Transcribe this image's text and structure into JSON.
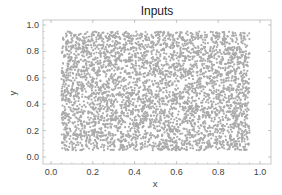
{
  "chart_data": {
    "type": "scatter",
    "title": "Inputs",
    "xlabel": "x",
    "ylabel": "y",
    "xlim": [
      -0.04,
      1.05
    ],
    "ylim": [
      -0.04,
      1.04
    ],
    "xticks": [
      0.0,
      0.2,
      0.4,
      0.6,
      0.8,
      1.0
    ],
    "yticks": [
      0.0,
      0.2,
      0.4,
      0.6,
      0.8,
      1.0
    ],
    "xtick_labels": [
      "0.0",
      "0.2",
      "0.4",
      "0.6",
      "0.8",
      "1.0"
    ],
    "ytick_labels": [
      "0.0",
      "0.2",
      "0.4",
      "0.6",
      "0.8",
      "1.0"
    ],
    "grid": false,
    "legend": null,
    "series": [
      {
        "name": "Inputs",
        "color": "#aaaaaa",
        "distribution": "uniform",
        "x_range": [
          0.05,
          0.95
        ],
        "y_range": [
          0.05,
          0.95
        ],
        "approx_count": 4000
      }
    ]
  },
  "colors": {
    "points": "#aaaaaa",
    "frame": "#bbbbbb",
    "text": "#444444"
  }
}
